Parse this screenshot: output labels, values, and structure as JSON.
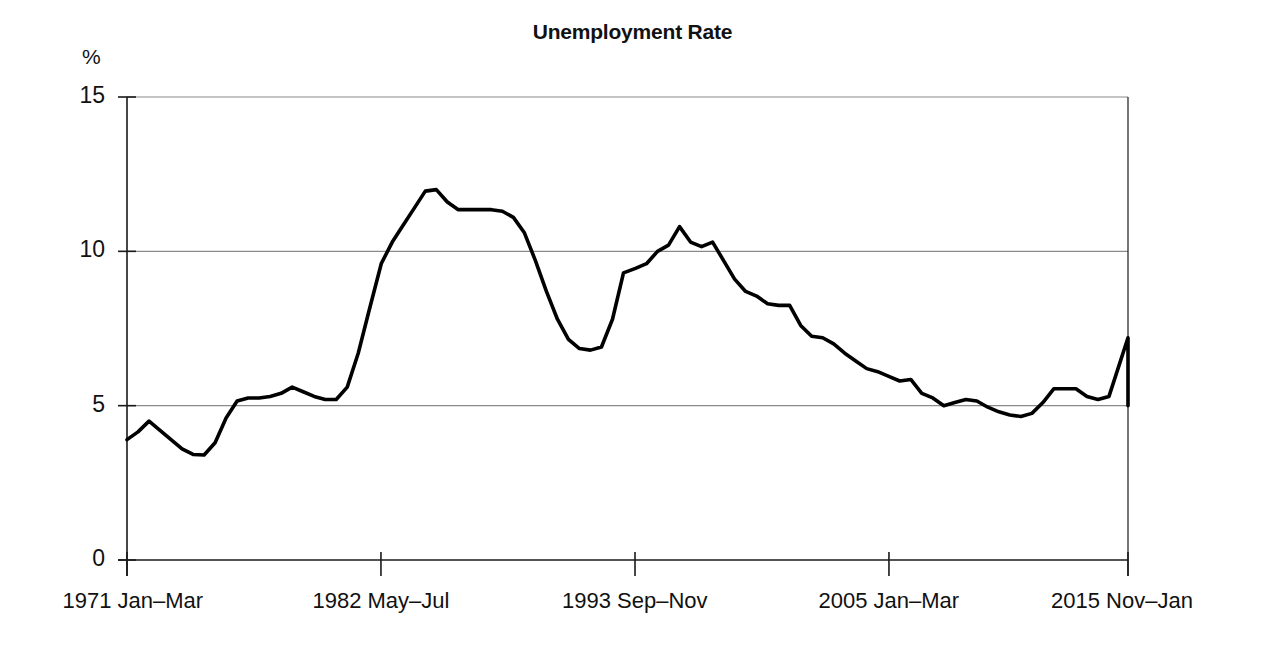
{
  "chart_data": {
    "type": "line",
    "title": "Unemployment Rate",
    "xlabel": "",
    "ylabel": "%",
    "ylim": [
      0,
      15
    ],
    "y_ticks": [
      0,
      5,
      10,
      15
    ],
    "y_tick_labels": [
      "0",
      "5",
      "10",
      "15"
    ],
    "grid": "horizontal",
    "legend": "none",
    "x_tick_labels": [
      "1971 Jan–Mar",
      "1982 May–Jul",
      "1993 Sep–Nov",
      "2005 Jan–Mar",
      "2015 Nov–Jan"
    ],
    "x_tick_positions": [
      0,
      0.2537,
      0.5075,
      0.7612,
      1.0
    ],
    "line_color": "#000000",
    "series": [
      {
        "name": "Unemployment Rate",
        "units": "percent",
        "x": [
          0.0,
          0.011,
          0.022,
          0.033,
          0.044,
          0.055,
          0.066,
          0.077,
          0.088,
          0.099,
          0.11,
          0.121,
          0.132,
          0.143,
          0.154,
          0.165,
          0.176,
          0.187,
          0.198,
          0.209,
          0.22,
          0.231,
          0.242,
          0.254,
          0.265,
          0.276,
          0.287,
          0.298,
          0.309,
          0.32,
          0.331,
          0.342,
          0.353,
          0.364,
          0.375,
          0.386,
          0.397,
          0.408,
          0.419,
          0.43,
          0.441,
          0.452,
          0.463,
          0.474,
          0.485,
          0.496,
          0.508,
          0.519,
          0.53,
          0.541,
          0.552,
          0.563,
          0.574,
          0.585,
          0.596,
          0.607,
          0.618,
          0.629,
          0.64,
          0.651,
          0.662,
          0.673,
          0.684,
          0.695,
          0.706,
          0.717,
          0.728,
          0.739,
          0.75,
          0.761,
          0.772,
          0.783,
          0.794,
          0.805,
          0.816,
          0.827,
          0.838,
          0.849,
          0.86,
          0.871,
          0.882,
          0.893,
          0.904,
          0.915,
          0.926,
          0.937,
          0.948,
          0.959,
          0.97,
          0.981,
          0.99,
          1.0
        ],
        "values": [
          3.9,
          4.15,
          4.5,
          4.2,
          3.9,
          3.6,
          3.42,
          3.4,
          3.8,
          4.6,
          5.15,
          5.25,
          5.25,
          5.3,
          5.4,
          5.6,
          5.45,
          5.3,
          5.2,
          5.2,
          5.6,
          6.7,
          8.1,
          9.6,
          10.3,
          10.85,
          11.4,
          11.95,
          12.0,
          11.6,
          11.35,
          11.35,
          11.35,
          11.35,
          11.3,
          11.1,
          10.6,
          9.7,
          8.7,
          7.8,
          7.15,
          6.85,
          6.8,
          6.9,
          7.8,
          9.3,
          9.45,
          9.6,
          10.0,
          10.2,
          10.8,
          10.3,
          10.15,
          10.3,
          9.7,
          9.1,
          8.7,
          8.55,
          8.3,
          8.25,
          8.25,
          7.6,
          7.25,
          7.2,
          7.0,
          6.7,
          6.45,
          6.2,
          6.1,
          5.95,
          5.8,
          5.85,
          5.4,
          5.25,
          5.0,
          5.1,
          5.2,
          5.15,
          4.95,
          4.8,
          4.7,
          4.65,
          4.75,
          5.1,
          5.55,
          5.55,
          5.55,
          5.3,
          5.2,
          5.3,
          6.2,
          7.2
        ]
      }
    ],
    "series_tail": {
      "comment_omitted": true
    },
    "series_continued": {
      "name": "Unemployment Rate (continued)",
      "x": [
        1.0
      ],
      "values": [
        5.0
      ]
    }
  },
  "axis": {
    "y_unit_label": "%"
  }
}
